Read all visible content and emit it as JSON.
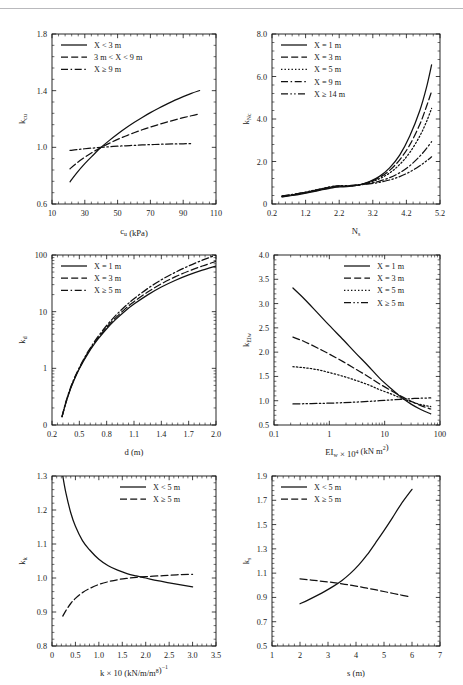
{
  "figure": {
    "title": "",
    "top_rule": true,
    "background": "#ffffff",
    "line_color": "#111111"
  },
  "chart_data": [
    {
      "id": "kcu",
      "type": "line",
      "title": "",
      "xlabel": "c_u (kPa)",
      "xlabel_parts": {
        "base": "c",
        "sub": "u",
        "tail": " (kPa)"
      },
      "ylabel": "k_cu",
      "ylabel_parts": {
        "base": "k",
        "sub": "cu"
      },
      "xlim": [
        10,
        110
      ],
      "ylim": [
        0.6,
        1.8
      ],
      "xticks": [
        10,
        30,
        50,
        70,
        90,
        110
      ],
      "yticks": [
        0.6,
        1.0,
        1.4,
        1.8
      ],
      "xtick_labels": [
        "10",
        "30",
        "50",
        "70",
        "90",
        "110"
      ],
      "ytick_labels": [
        "0.6",
        "1.0",
        "1.4",
        "1.8"
      ],
      "xminor_count": 4,
      "yminor_count": 4,
      "grid": false,
      "legend_position": "upper-left",
      "series": [
        {
          "name": "X < 3 m",
          "dash": "solid",
          "x": [
            21,
            25,
            30,
            35,
            40,
            45,
            50,
            55,
            60,
            65,
            70,
            75,
            80,
            85,
            90,
            95,
            100
          ],
          "y": [
            0.757,
            0.818,
            0.885,
            0.944,
            1.0,
            1.049,
            1.094,
            1.136,
            1.175,
            1.211,
            1.245,
            1.276,
            1.305,
            1.333,
            1.358,
            1.381,
            1.401
          ]
        },
        {
          "name": "3 m < X < 9 m",
          "dash": "dashed",
          "x": [
            21,
            25,
            30,
            35,
            40,
            45,
            50,
            55,
            60,
            65,
            70,
            75,
            80,
            85,
            90,
            95,
            100
          ],
          "y": [
            0.849,
            0.888,
            0.93,
            0.967,
            1.0,
            1.029,
            1.056,
            1.08,
            1.103,
            1.124,
            1.143,
            1.161,
            1.178,
            1.194,
            1.209,
            1.223,
            1.236
          ]
        },
        {
          "name": "X ≥ 9 m",
          "dash": "dashdot",
          "x": [
            21,
            25,
            30,
            35,
            40,
            45,
            50,
            55,
            60,
            65,
            70,
            75,
            80,
            85,
            90,
            95
          ],
          "y": [
            0.978,
            0.984,
            0.99,
            0.995,
            1.0,
            1.004,
            1.008,
            1.011,
            1.014,
            1.017,
            1.019,
            1.021,
            1.023,
            1.024,
            1.025,
            1.026
          ]
        }
      ]
    },
    {
      "id": "kNc",
      "type": "line",
      "title": "",
      "xlabel": "N_s",
      "xlabel_parts": {
        "base": "N",
        "sub": "s",
        "tail": ""
      },
      "ylabel": "k_Nc",
      "ylabel_parts": {
        "base": "k",
        "sub": "Nc"
      },
      "xlim": [
        0.2,
        5.2
      ],
      "ylim": [
        0,
        8.0
      ],
      "xticks": [
        0.2,
        1.2,
        2.2,
        3.2,
        4.2,
        5.2
      ],
      "yticks": [
        0,
        2.0,
        4.0,
        6.0,
        8.0
      ],
      "xtick_labels": [
        "0.2",
        "1.2",
        "2.2",
        "3.2",
        "4.2",
        "5.2"
      ],
      "ytick_labels": [
        "0",
        "2.0",
        "4.0",
        "6.0",
        "8.0"
      ],
      "xminor_count": 4,
      "yminor_count": 4,
      "grid": false,
      "legend_position": "upper-left",
      "series": [
        {
          "name": "X = 1 m",
          "dash": "solid",
          "x": [
            0.5,
            0.8,
            1.1,
            1.4,
            1.7,
            2.0,
            2.2,
            2.5,
            2.8,
            3.1,
            3.4,
            3.7,
            4.0,
            4.3,
            4.6,
            4.8,
            4.95
          ],
          "y": [
            0.33,
            0.4,
            0.48,
            0.57,
            0.67,
            0.76,
            0.8,
            0.83,
            0.9,
            1.05,
            1.3,
            1.7,
            2.3,
            3.2,
            4.4,
            5.5,
            6.55
          ]
        },
        {
          "name": "X = 3 m",
          "dash": "dashed",
          "x": [
            0.5,
            0.8,
            1.1,
            1.4,
            1.7,
            2.0,
            2.2,
            2.5,
            2.8,
            3.1,
            3.4,
            3.7,
            4.0,
            4.3,
            4.6,
            4.8,
            4.95
          ],
          "y": [
            0.35,
            0.42,
            0.5,
            0.59,
            0.69,
            0.78,
            0.82,
            0.84,
            0.9,
            1.03,
            1.25,
            1.58,
            2.08,
            2.78,
            3.75,
            4.6,
            5.3
          ]
        },
        {
          "name": "X = 5 m",
          "dash": "dotted",
          "x": [
            0.5,
            0.8,
            1.1,
            1.4,
            1.7,
            2.0,
            2.2,
            2.5,
            2.8,
            3.1,
            3.4,
            3.7,
            4.0,
            4.3,
            4.6,
            4.8,
            4.95
          ],
          "y": [
            0.36,
            0.43,
            0.51,
            0.6,
            0.7,
            0.8,
            0.83,
            0.85,
            0.9,
            1.01,
            1.19,
            1.46,
            1.86,
            2.42,
            3.2,
            3.88,
            4.5
          ]
        },
        {
          "name": "X = 9 m",
          "dash": "dashdot",
          "x": [
            0.5,
            0.8,
            1.1,
            1.4,
            1.7,
            2.0,
            2.2,
            2.5,
            2.8,
            3.1,
            3.4,
            3.7,
            4.0,
            4.3,
            4.6,
            4.8,
            4.95
          ],
          "y": [
            0.37,
            0.44,
            0.52,
            0.62,
            0.72,
            0.82,
            0.85,
            0.86,
            0.9,
            0.97,
            1.08,
            1.24,
            1.47,
            1.8,
            2.25,
            2.62,
            2.93
          ]
        },
        {
          "name": "X ≥ 14 m",
          "dash": "dashdotdot",
          "x": [
            0.5,
            0.8,
            1.1,
            1.4,
            1.7,
            2.0,
            2.2,
            2.5,
            2.8,
            3.1,
            3.4,
            3.7,
            4.0,
            4.3,
            4.6,
            4.8,
            4.95
          ],
          "y": [
            0.38,
            0.45,
            0.53,
            0.63,
            0.73,
            0.83,
            0.86,
            0.87,
            0.9,
            0.95,
            1.02,
            1.13,
            1.29,
            1.51,
            1.8,
            2.03,
            2.22
          ]
        }
      ]
    },
    {
      "id": "kd",
      "type": "line",
      "title": "",
      "xlabel": "d (m)",
      "xlabel_parts": {
        "base": "d (m)",
        "sub": "",
        "tail": ""
      },
      "ylabel": "k_d",
      "ylabel_parts": {
        "base": "k",
        "sub": "d"
      },
      "xlim": [
        0.2,
        2.0
      ],
      "ylim_log": [
        0.1,
        100
      ],
      "yscale": "log",
      "xticks": [
        0.2,
        0.5,
        0.8,
        1.1,
        1.4,
        1.7,
        2.0
      ],
      "yticks": [
        0.1,
        1,
        10,
        100
      ],
      "xtick_labels": [
        "0.2",
        "0.5",
        "0.8",
        "1.1",
        "1.4",
        "1.7",
        "2.0"
      ],
      "ytick_labels": [
        "0",
        "1",
        "10",
        "100"
      ],
      "xminor_count": 4,
      "grid": false,
      "legend_position": "upper-left",
      "series": [
        {
          "name": "X = 1 m",
          "dash": "solid",
          "x": [
            0.31,
            0.35,
            0.4,
            0.45,
            0.5,
            0.55,
            0.6,
            0.65,
            0.7,
            0.8,
            0.9,
            1.0,
            1.1,
            1.25,
            1.4,
            1.55,
            1.7,
            1.85,
            2.0
          ],
          "y": [
            0.14,
            0.24,
            0.42,
            0.66,
            0.98,
            1.38,
            1.88,
            2.48,
            3.2,
            5.0,
            7.3,
            10.2,
            13.6,
            19.8,
            27.2,
            35.5,
            44.5,
            54.0,
            64.0
          ]
        },
        {
          "name": "X = 3 m",
          "dash": "dashed",
          "x": [
            0.31,
            0.35,
            0.4,
            0.45,
            0.5,
            0.55,
            0.6,
            0.65,
            0.7,
            0.8,
            0.9,
            1.0,
            1.1,
            1.25,
            1.4,
            1.55,
            1.7,
            1.85,
            2.0
          ],
          "y": [
            0.14,
            0.24,
            0.43,
            0.68,
            1.0,
            1.42,
            1.95,
            2.58,
            3.35,
            5.3,
            7.85,
            11.1,
            15.0,
            22.2,
            31.0,
            41.0,
            52.0,
            64.0,
            77.0
          ]
        },
        {
          "name": "X ≥ 5 m",
          "dash": "dashdot",
          "x": [
            0.31,
            0.35,
            0.4,
            0.45,
            0.5,
            0.55,
            0.6,
            0.65,
            0.7,
            0.8,
            0.9,
            1.0,
            1.1,
            1.25,
            1.4,
            1.55,
            1.7,
            1.85,
            2.0
          ],
          "y": [
            0.14,
            0.25,
            0.44,
            0.7,
            1.03,
            1.47,
            2.03,
            2.7,
            3.55,
            5.7,
            8.6,
            12.3,
            16.9,
            25.6,
            36.5,
            49.2,
            64.0,
            81.0,
            100.0
          ]
        }
      ]
    },
    {
      "id": "kEIw",
      "type": "line",
      "title": "",
      "xlabel": "EI_w × 10^4 (kN m^2)",
      "xlabel_parts": {
        "base": "EI",
        "sub": "w",
        "tail": " × 10",
        "sup": "4",
        "tail2": " (kN m",
        "sup2": "2",
        "tail3": ")"
      },
      "ylabel": "k_EIw",
      "ylabel_parts": {
        "base": "k",
        "sub": "EIw"
      },
      "xlim_log": [
        0.1,
        100
      ],
      "xscale": "log",
      "ylim": [
        0.5,
        4.0
      ],
      "xticks": [
        0.1,
        1,
        10,
        100
      ],
      "yticks": [
        0.5,
        1.0,
        1.5,
        2.0,
        2.5,
        3.0,
        3.5,
        4.0
      ],
      "xtick_labels": [
        "0.1",
        "1",
        "10",
        "100"
      ],
      "ytick_labels": [
        "0.5",
        "1.0",
        "1.5",
        "2.0",
        "2.5",
        "3.0",
        "3.5",
        "4.0"
      ],
      "yminor_count": 4,
      "grid": false,
      "legend_position": "upper-right",
      "series": [
        {
          "name": "X = 1 m",
          "dash": "solid",
          "x": [
            0.22,
            0.35,
            0.6,
            1.0,
            1.8,
            3.0,
            5.0,
            8.0,
            13.0,
            20.0,
            30.0,
            45.0,
            68.0
          ],
          "y": [
            3.32,
            3.1,
            2.82,
            2.55,
            2.25,
            1.98,
            1.72,
            1.47,
            1.25,
            1.07,
            0.93,
            0.82,
            0.73
          ]
        },
        {
          "name": "X = 3 m",
          "dash": "dashed",
          "x": [
            0.22,
            0.35,
            0.6,
            1.0,
            1.8,
            3.0,
            5.0,
            8.0,
            13.0,
            20.0,
            30.0,
            45.0,
            68.0
          ],
          "y": [
            2.31,
            2.22,
            2.09,
            1.96,
            1.8,
            1.65,
            1.5,
            1.35,
            1.21,
            1.09,
            0.99,
            0.9,
            0.83
          ]
        },
        {
          "name": "X = 5 m",
          "dash": "dotted",
          "x": [
            0.22,
            0.35,
            0.6,
            1.0,
            1.8,
            3.0,
            5.0,
            8.0,
            13.0,
            20.0,
            30.0,
            45.0,
            68.0
          ],
          "y": [
            1.7,
            1.68,
            1.64,
            1.58,
            1.5,
            1.42,
            1.33,
            1.23,
            1.14,
            1.05,
            0.98,
            0.92,
            0.88
          ]
        },
        {
          "name": "X ≥ 5 m",
          "dash": "dashdotdot",
          "x": [
            0.22,
            0.35,
            0.6,
            1.0,
            1.8,
            3.0,
            5.0,
            8.0,
            13.0,
            20.0,
            30.0,
            45.0,
            68.0
          ],
          "y": [
            0.935,
            0.938,
            0.943,
            0.95,
            0.96,
            0.972,
            0.985,
            1.0,
            1.015,
            1.03,
            1.042,
            1.052,
            1.058
          ]
        }
      ]
    },
    {
      "id": "kk",
      "type": "line",
      "title": "",
      "xlabel": "k × 10^8 (kN/m/m^-1)",
      "xlabel_parts": {
        "base": "k × 10",
        "sup": "8",
        "tail": " (kN/m/m",
        "sup2": "−1",
        "tail2": ")"
      },
      "ylabel": "k_k",
      "ylabel_parts": {
        "base": "k",
        "sub": "k"
      },
      "xlim": [
        0,
        3.5
      ],
      "ylim": [
        0.8,
        1.3
      ],
      "xticks": [
        0,
        0.5,
        1.0,
        1.5,
        2.0,
        2.5,
        3.0,
        3.5
      ],
      "yticks": [
        0.8,
        0.9,
        1.0,
        1.1,
        1.2,
        1.3
      ],
      "xtick_labels": [
        "0",
        "0.5",
        "1.0",
        "1.5",
        "2.0",
        "2.5",
        "3.0",
        "3.5"
      ],
      "ytick_labels": [
        "0.8",
        "0.9",
        "1.0",
        "1.1",
        "1.2",
        "1.3"
      ],
      "xminor_count": 4,
      "yminor_count": 4,
      "grid": false,
      "legend_position": "upper-right",
      "series": [
        {
          "name": "X < 5 m",
          "dash": "solid",
          "x": [
            0.23,
            0.3,
            0.4,
            0.5,
            0.65,
            0.8,
            1.0,
            1.2,
            1.4,
            1.6,
            1.8,
            2.0,
            2.25,
            2.5,
            2.75,
            3.0
          ],
          "y": [
            1.3,
            1.248,
            1.192,
            1.152,
            1.11,
            1.083,
            1.055,
            1.036,
            1.023,
            1.013,
            1.006,
            1.0,
            0.992,
            0.986,
            0.98,
            0.974
          ]
        },
        {
          "name": "X ≥ 5 m",
          "dash": "dashed",
          "x": [
            0.23,
            0.3,
            0.4,
            0.5,
            0.65,
            0.8,
            1.0,
            1.2,
            1.4,
            1.6,
            1.8,
            2.0,
            2.25,
            2.5,
            2.75,
            3.0
          ],
          "y": [
            0.888,
            0.905,
            0.925,
            0.94,
            0.957,
            0.969,
            0.981,
            0.989,
            0.995,
            0.999,
            1.002,
            1.004,
            1.006,
            1.008,
            1.01,
            1.011
          ]
        }
      ]
    },
    {
      "id": "ks",
      "type": "line",
      "title": "",
      "xlabel": "s (m)",
      "xlabel_parts": {
        "base": "s (m)",
        "sub": "",
        "tail": ""
      },
      "ylabel": "k_s",
      "ylabel_parts": {
        "base": "k",
        "sub": "s"
      },
      "xlim": [
        1,
        7
      ],
      "ylim": [
        0.5,
        1.9
      ],
      "xticks": [
        1,
        2,
        3,
        4,
        5,
        6,
        7
      ],
      "yticks": [
        0.5,
        0.7,
        0.9,
        1.1,
        1.3,
        1.5,
        1.7,
        1.9
      ],
      "xtick_labels": [
        "1",
        "2",
        "3",
        "4",
        "5",
        "6",
        "7"
      ],
      "ytick_labels": [
        "0.5",
        "0.7",
        "0.9",
        "1.1",
        "1.3",
        "1.5",
        "1.7",
        "1.9"
      ],
      "xminor_count": 4,
      "yminor_count": 4,
      "grid": false,
      "legend_position": "upper-left",
      "series": [
        {
          "name": "X < 5 m",
          "dash": "solid",
          "x": [
            2.0,
            2.3,
            2.6,
            2.9,
            3.2,
            3.5,
            3.8,
            4.1,
            4.4,
            4.7,
            5.0,
            5.3,
            5.6,
            6.0
          ],
          "y": [
            0.848,
            0.88,
            0.915,
            0.952,
            0.993,
            1.04,
            1.098,
            1.168,
            1.252,
            1.35,
            1.45,
            1.555,
            1.665,
            1.79
          ]
        },
        {
          "name": "X ≥ 5 m",
          "dash": "dashed",
          "x": [
            2.0,
            2.4,
            2.8,
            3.2,
            3.6,
            4.0,
            4.4,
            4.8,
            5.2,
            5.6,
            5.9
          ],
          "y": [
            1.053,
            1.043,
            1.033,
            1.022,
            1.008,
            0.993,
            0.976,
            0.958,
            0.939,
            0.92,
            0.906
          ]
        }
      ]
    }
  ]
}
